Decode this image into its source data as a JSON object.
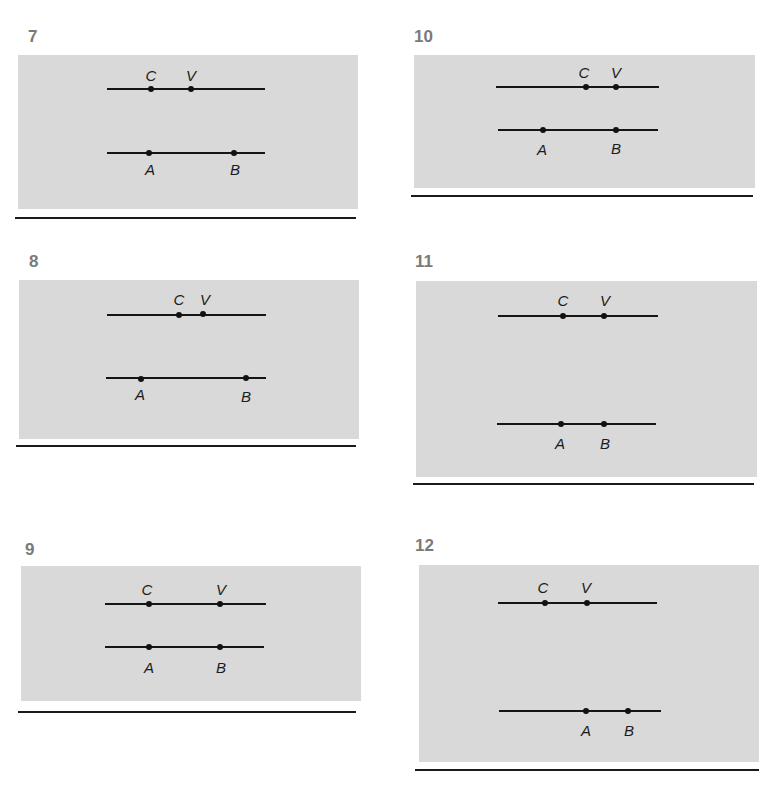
{
  "figure": {
    "colors": {
      "panel_background": "#d9d9d9",
      "line": "#151515",
      "number": "#7a7a7a",
      "label": "#1c1c1c"
    }
  },
  "panels": [
    {
      "number": "7",
      "top_line": {
        "points": [
          {
            "label": "C"
          },
          {
            "label": "V"
          }
        ]
      },
      "bottom_line": {
        "points": [
          {
            "label": "A"
          },
          {
            "label": "B"
          }
        ]
      }
    },
    {
      "number": "8",
      "top_line": {
        "points": [
          {
            "label": "C"
          },
          {
            "label": "V"
          }
        ]
      },
      "bottom_line": {
        "points": [
          {
            "label": "A"
          },
          {
            "label": "B"
          }
        ]
      }
    },
    {
      "number": "9",
      "top_line": {
        "points": [
          {
            "label": "C"
          },
          {
            "label": "V"
          }
        ]
      },
      "bottom_line": {
        "points": [
          {
            "label": "A"
          },
          {
            "label": "B"
          }
        ]
      }
    },
    {
      "number": "10",
      "top_line": {
        "points": [
          {
            "label": "C"
          },
          {
            "label": "V"
          }
        ]
      },
      "bottom_line": {
        "points": [
          {
            "label": "A"
          },
          {
            "label": "B"
          }
        ]
      }
    },
    {
      "number": "11",
      "top_line": {
        "points": [
          {
            "label": "C"
          },
          {
            "label": "V"
          }
        ]
      },
      "bottom_line": {
        "points": [
          {
            "label": "A"
          },
          {
            "label": "B"
          }
        ]
      }
    },
    {
      "number": "12",
      "top_line": {
        "points": [
          {
            "label": "C"
          },
          {
            "label": "V"
          }
        ]
      },
      "bottom_line": {
        "points": [
          {
            "label": "A"
          },
          {
            "label": "B"
          }
        ]
      }
    }
  ]
}
